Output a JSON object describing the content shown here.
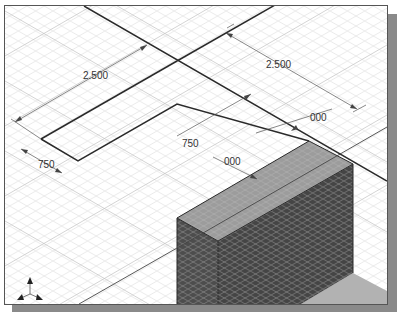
{
  "viewport": {
    "view": "isometric",
    "grid": true
  },
  "dimensions": [
    {
      "id": "dim-top-left-length",
      "label": "2.500"
    },
    {
      "id": "dim-top-right-length",
      "label": "2.500"
    },
    {
      "id": "dim-left-width",
      "label": "750"
    },
    {
      "id": "dim-mid-width",
      "label": "750"
    },
    {
      "id": "dim-right-offset",
      "label": "000"
    },
    {
      "id": "dim-mid-offset",
      "label": "000"
    }
  ],
  "colors": {
    "grid": "#d4d4d4",
    "outline": "#333333",
    "block_top": "#9a9a9a",
    "block_side": "#4a4a4a",
    "floor": "#b0b0b0",
    "shadow": "#8a8a8a"
  },
  "triad": {
    "icon": "axis-triad-icon"
  }
}
